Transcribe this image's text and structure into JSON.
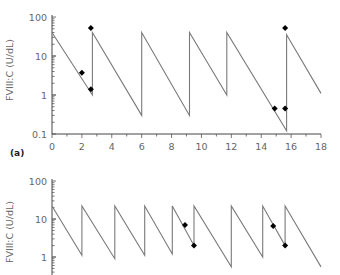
{
  "chart_data": [
    {
      "type": "line",
      "panel_label": "(a)",
      "title": "",
      "xlabel": "",
      "ylabel": "FVIII:C (U/dL)",
      "yscale": "log",
      "ylim": [
        0.1,
        100
      ],
      "xlim": [
        0,
        18
      ],
      "xticks": [
        0,
        2,
        4,
        6,
        8,
        10,
        12,
        14,
        16,
        18
      ],
      "yticks": [
        {
          "value": 0.1,
          "label": "0.1"
        },
        {
          "value": 1,
          "label": "1"
        },
        {
          "value": 10,
          "label": "10"
        },
        {
          "value": 100,
          "label": "100"
        }
      ],
      "grid": false,
      "line_color": "#7a7a7a",
      "marker_color": "#000000",
      "series": [
        {
          "name": "predicted FVIII:C",
          "points": [
            [
              0,
              40
            ],
            [
              2.7,
              1.0
            ],
            [
              2.7,
              40
            ],
            [
              6.0,
              0.3
            ],
            [
              6.0,
              40
            ],
            [
              9.2,
              0.3
            ],
            [
              9.2,
              40
            ],
            [
              11.7,
              1.0
            ],
            [
              11.7,
              40
            ],
            [
              15.7,
              0.12
            ],
            [
              15.7,
              35
            ],
            [
              18,
              1.1
            ]
          ]
        },
        {
          "name": "measured FVIII:C",
          "markers": [
            [
              2.0,
              3.7
            ],
            [
              2.6,
              1.4
            ],
            [
              2.6,
              52
            ],
            [
              14.9,
              0.45
            ],
            [
              15.6,
              0.45
            ],
            [
              15.6,
              52
            ]
          ]
        }
      ]
    },
    {
      "type": "line",
      "panel_label": "",
      "title": "",
      "xlabel": "",
      "ylabel": "FVIII:C (U/dL)",
      "yscale": "log",
      "ylim": [
        0.1,
        100
      ],
      "xlim": [
        0,
        18
      ],
      "yticks": [
        {
          "value": 1,
          "label": "1"
        },
        {
          "value": 10,
          "label": "10"
        },
        {
          "value": 100,
          "label": "100"
        }
      ],
      "grid": false,
      "line_color": "#7a7a7a",
      "marker_color": "#000000",
      "series": [
        {
          "name": "predicted FVIII:C",
          "points": [
            [
              0,
              22
            ],
            [
              2.0,
              1.1
            ],
            [
              2.0,
              22
            ],
            [
              4.2,
              0.9
            ],
            [
              4.2,
              22
            ],
            [
              6.2,
              1.1
            ],
            [
              6.2,
              22
            ],
            [
              8.05,
              1.2
            ],
            [
              8.05,
              22
            ],
            [
              9.5,
              2.0
            ],
            [
              9.5,
              22
            ],
            [
              12.0,
              0.55
            ],
            [
              12.0,
              22
            ],
            [
              14.1,
              1.0
            ],
            [
              14.1,
              22
            ],
            [
              15.6,
              2.0
            ],
            [
              15.6,
              22
            ],
            [
              18,
              0.55
            ]
          ]
        },
        {
          "name": "measured FVIII:C",
          "markers": [
            [
              8.9,
              7.0
            ],
            [
              9.5,
              2.0
            ],
            [
              14.8,
              6.5
            ],
            [
              15.6,
              2.0
            ]
          ]
        }
      ]
    }
  ]
}
